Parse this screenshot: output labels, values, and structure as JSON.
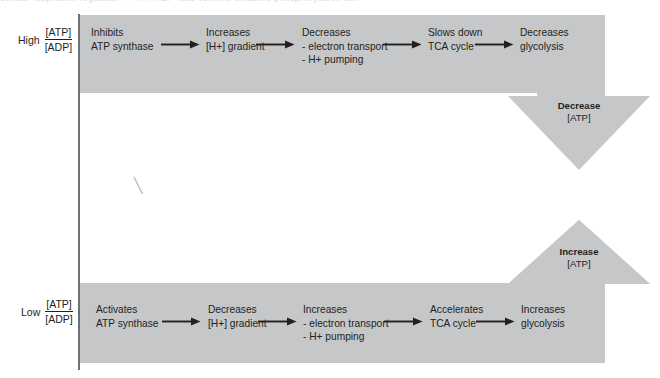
{
  "figure": {
    "scan_header_text": "cellular respiration regulation — ATP/ADP ratio controls oxidative phosphorylation flux",
    "band_color": "#c6c7c9",
    "text_color": "#231f20",
    "rule_color": "#6e7074"
  },
  "high_row": {
    "ratio_prefix": "High",
    "ratio_numerator": "[ATP]",
    "ratio_denominator": "[ADP]",
    "steps": [
      {
        "line1": "Inhibits",
        "line2": "ATP synthase",
        "line3": ""
      },
      {
        "line1": "Increases",
        "line2": "[H+] gradient",
        "line3": ""
      },
      {
        "line1": "Decreases",
        "line2": "- electron transport",
        "line3": "- H+ pumping"
      },
      {
        "line1": "Slows down",
        "line2": "TCA cycle",
        "line3": ""
      },
      {
        "line1": "Decreases",
        "line2": "glycolysis",
        "line3": ""
      }
    ]
  },
  "low_row": {
    "ratio_prefix": "Low",
    "ratio_numerator": "[ATP]",
    "ratio_denominator": "[ADP]",
    "steps": [
      {
        "line1": "Activates",
        "line2": "ATP synthase",
        "line3": ""
      },
      {
        "line1": "Decreases",
        "line2": "[H+] gradient",
        "line3": ""
      },
      {
        "line1": "Increases",
        "line2": "- electron transport",
        "line3": "- H+ pumping"
      },
      {
        "line1": "Accelerates",
        "line2": "TCA cycle",
        "line3": ""
      },
      {
        "line1": "Increases",
        "line2": "glycolysis",
        "line3": ""
      }
    ]
  },
  "outcome_down": {
    "label_line1": "Decrease",
    "label_line2": "[ATP]",
    "direction": "down",
    "icon": "block-arrow-down-icon"
  },
  "outcome_up": {
    "label_line1": "Increase",
    "label_line2": "[ATP]",
    "direction": "up",
    "icon": "block-arrow-up-icon"
  },
  "connectors": {
    "icon": "arrow-right-icon",
    "count_per_row": 4
  }
}
